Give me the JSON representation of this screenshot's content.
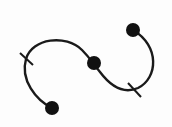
{
  "icon": {
    "name": "bezier-curve-icon",
    "stroke_color": "#1a1a1a",
    "node_color": "#111111",
    "background": "#fdfdfd"
  },
  "path": {
    "d": "M52,108 C36,100 20,80 26,59 C32,38 66,34 82,50 C90,58 92,62 100,72 C112,88 124,94 138,88 C158,78 160,46 133,30",
    "stroke_width": 2.4
  },
  "nodes": [
    {
      "id": "start-node",
      "cx": 52,
      "cy": 108,
      "r": 7
    },
    {
      "id": "middle-node",
      "cx": 94,
      "cy": 63,
      "r": 7
    },
    {
      "id": "end-node",
      "cx": 133,
      "cy": 30,
      "r": 7
    }
  ],
  "ticks": [
    {
      "id": "left-tick",
      "x1": 20,
      "y1": 53,
      "x2": 33,
      "y2": 65
    },
    {
      "id": "bottom-tick",
      "x1": 128,
      "y1": 83,
      "x2": 141,
      "y2": 97
    }
  ]
}
